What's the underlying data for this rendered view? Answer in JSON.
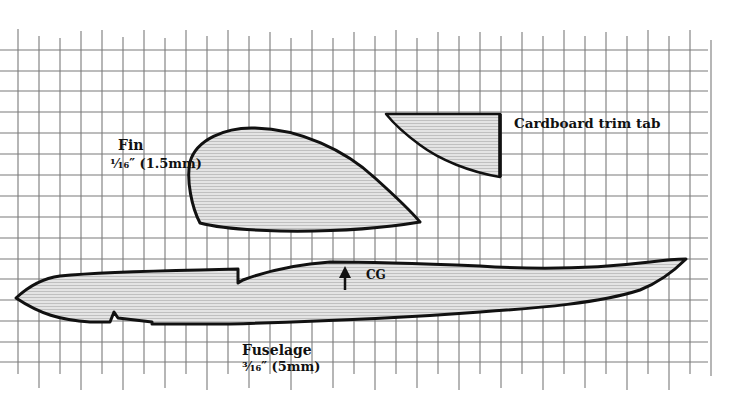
{
  "diagram": {
    "type": "glider-parts-template-on-grid",
    "grid": {
      "line_color": "#7a7a7a",
      "cell_size_px": 21,
      "columns_x": [
        18,
        39,
        60,
        81,
        102,
        123,
        144,
        165,
        186,
        207,
        228,
        249,
        270,
        291,
        312,
        333,
        354,
        375,
        396,
        417,
        438,
        459,
        480,
        501,
        522,
        543,
        564,
        585,
        606,
        627,
        648,
        669,
        690,
        711
      ],
      "rows_y": [
        50,
        71,
        91,
        112,
        133,
        154,
        175,
        196,
        217,
        238,
        259,
        279,
        300,
        321,
        342,
        362
      ]
    },
    "parts": {
      "fin": {
        "name": "Fin",
        "spec": "¹⁄₁₆″ (1.5mm)"
      },
      "trim_tab": {
        "name": "Cardboard trim tab"
      },
      "fuselage": {
        "name": "Fuselage",
        "spec": "³⁄₁₆″ (5mm)"
      },
      "cg_marker": {
        "label": "CG",
        "icon": "up-arrow"
      }
    },
    "colors": {
      "outline": "#111111",
      "fill": "#dcdcdc",
      "hatch": "#bdbdbd",
      "background": "#ffffff"
    }
  }
}
